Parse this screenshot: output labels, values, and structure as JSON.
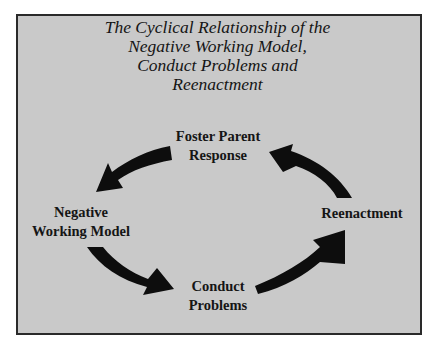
{
  "diagram": {
    "title_lines": [
      "The Cyclical Relationship of the",
      "Negative Working Model,",
      "Conduct Problems and",
      "Reenactment"
    ],
    "nodes": {
      "foster_parent_response": {
        "lines": [
          "Foster Parent",
          "Response"
        ]
      },
      "negative_working_model": {
        "lines": [
          "Negative",
          "Working Model"
        ]
      },
      "reenactment": {
        "lines": [
          "Reenactment"
        ]
      },
      "conduct_problems": {
        "lines": [
          "Conduct",
          "Problems"
        ]
      }
    },
    "edges": [
      {
        "from": "Foster Parent Response",
        "to": "Negative Working Model"
      },
      {
        "from": "Negative Working Model",
        "to": "Conduct Problems"
      },
      {
        "from": "Conduct Problems",
        "to": "Reenactment"
      },
      {
        "from": "Reenactment",
        "to": "Foster Parent Response"
      }
    ],
    "colors": {
      "background": "#c9c9c9",
      "border": "#2a2a2a",
      "arrow": "#0d0d0d",
      "text": "#151515"
    }
  }
}
